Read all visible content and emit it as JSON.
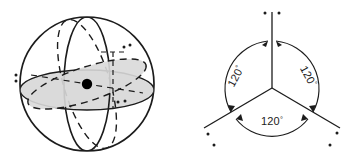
{
  "figure": {
    "background_color": "#ffffff",
    "stroke_color": "#1c1c1c",
    "shade_color": "#d9d9d9",
    "panels": [
      {
        "id": "sphere-panel",
        "name": "sphere-with-trigonal-plane",
        "center": {
          "x": 87,
          "y": 84
        },
        "radius": 67,
        "sphere_outline": "solid",
        "vertical_meridian": "solid",
        "back_meridian": "dashed",
        "equator": "solid",
        "inner_plane": {
          "description": "tilted shaded ellipse representing the trigonal plane",
          "fill": "#d9d9d9",
          "edge": "dashed",
          "tilt_degrees": -18
        },
        "center_dot": {
          "name": "central-atom-dot",
          "fill": "#000000",
          "radius": 5
        },
        "lone_pair_dots": [
          {
            "label": "left-vertex-pair",
            "x": 21,
            "y": 78
          },
          {
            "label": "upper-right-pair",
            "x": 127,
            "y": 49
          },
          {
            "label": "lower-right-pair",
            "x": 121,
            "y": 101
          }
        ]
      },
      {
        "id": "angle-panel",
        "name": "trigonal-planar-bond-angles",
        "center": {
          "x": 272,
          "y": 88
        },
        "bond_length": 78,
        "bonds": [
          {
            "name": "bond-up",
            "direction_degrees": 90,
            "terminal_dots": 2
          },
          {
            "name": "bond-lower-left",
            "direction_degrees": 210,
            "terminal_dots": 2
          },
          {
            "name": "bond-lower-right",
            "direction_degrees": 330,
            "terminal_dots": 2
          }
        ],
        "angles": [
          {
            "name": "angle-upper-left",
            "value": "120",
            "degree_symbol": "°",
            "rotation": -62
          },
          {
            "name": "angle-upper-right",
            "value": "120",
            "degree_symbol": "°",
            "rotation": 62
          },
          {
            "name": "angle-bottom",
            "value": "120",
            "degree_symbol": "°",
            "rotation": 0
          }
        ],
        "arrow_style": "double-headed-arc"
      }
    ]
  }
}
